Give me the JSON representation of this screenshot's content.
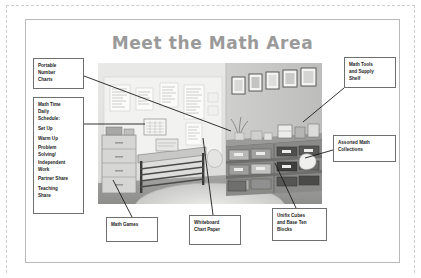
{
  "slide": {
    "title": "Meet the Math Area",
    "title_color": "#9a9a9a",
    "frame_color": "#b9b9b9"
  },
  "photo": {
    "alt_name": "classroom-math-area-photo",
    "description": "Classroom math area corner with whiteboard chart papers, shelving with bins, drawer unit, bench and round rug"
  },
  "callouts": {
    "portable_number_charts": {
      "line1": "Portable",
      "line2": "Number",
      "line3": "Charts"
    },
    "math_time_daily_schedule": {
      "header1": "Math Time",
      "header2": "Daily",
      "header3": "Schedule:",
      "items": [
        "Set Up",
        "Warm Up",
        "Problem",
        "Solving/",
        "Independent",
        "Work",
        "Partner Share",
        "Teaching",
        "Share"
      ],
      "item_set_up": "Set Up",
      "item_warm_up": "Warm Up",
      "item_problem_1": "Problem",
      "item_problem_2": "Solving/",
      "item_problem_3": "Independent",
      "item_problem_4": "Work",
      "item_partner_share": "Partner Share",
      "item_teaching_1": "Teaching",
      "item_teaching_2": "Share"
    },
    "math_tools_supply_shelf": {
      "line1": "Math Tools",
      "line2": "and Supply",
      "line3": "Shelf"
    },
    "assorted_math_collections": {
      "line1": "Assorted Math",
      "line2": "Collections"
    },
    "math_games": {
      "line1": "Math Games"
    },
    "whiteboard_chart_paper": {
      "line1": "Whiteboard",
      "line2": "Chart Paper"
    },
    "unifix_cubes_base_ten": {
      "line1": "Unifix Cubes",
      "line2": "and Base Ten",
      "line3": "Blocks"
    }
  }
}
